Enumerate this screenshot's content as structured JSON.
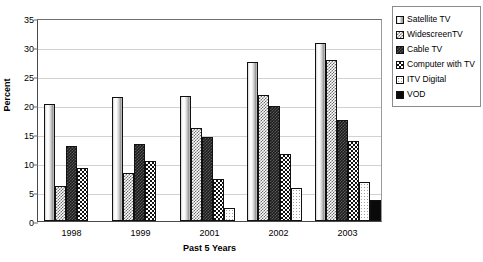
{
  "chart_data": {
    "type": "bar",
    "title": "",
    "xlabel": "Past 5 Years",
    "ylabel": "Percent",
    "categories": [
      "1998",
      "1999",
      "2001",
      "2002",
      "2003"
    ],
    "ylim": [
      0,
      35
    ],
    "yticks": [
      0,
      5,
      10,
      15,
      20,
      25,
      30,
      35
    ],
    "grid": true,
    "legend_position": "right",
    "series": [
      {
        "name": "Satellite TV",
        "pattern": "vertical-gradient-cylinder",
        "values": [
          20.2,
          21.3,
          21.6,
          27.5,
          30.7
        ]
      },
      {
        "name": "WidescreenTV",
        "pattern": "light-checker",
        "values": [
          6.1,
          8.2,
          16.1,
          21.8,
          27.8
        ]
      },
      {
        "name": "Cable TV",
        "pattern": "dark-checker",
        "values": [
          13.0,
          13.2,
          14.4,
          19.9,
          17.5
        ]
      },
      {
        "name": "Computer with TV",
        "pattern": "black-white-checker",
        "values": [
          9.1,
          10.3,
          7.3,
          11.6,
          13.8
        ]
      },
      {
        "name": "ITV Digital",
        "pattern": "fine-dots",
        "values": [
          null,
          null,
          2.3,
          5.7,
          6.7
        ]
      },
      {
        "name": "VOD",
        "pattern": "solid-black",
        "values": [
          null,
          null,
          null,
          null,
          3.7
        ]
      }
    ]
  },
  "legend": {
    "items": [
      {
        "label": "Satellite TV"
      },
      {
        "label": "WidescreenTV"
      },
      {
        "label": "Cable TV"
      },
      {
        "label": "Computer with TV"
      },
      {
        "label": "ITV Digital"
      },
      {
        "label": "VOD"
      }
    ]
  }
}
